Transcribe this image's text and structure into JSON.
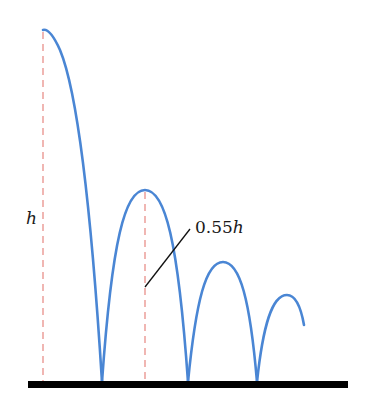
{
  "diagram": {
    "labels": {
      "initial_height": "h",
      "rebound_height": "0.55h"
    },
    "colors": {
      "trajectory": "#4a86d4",
      "dashed_guides": "#e8908a",
      "ground": "#000000",
      "leader_line": "#111111"
    },
    "bounces": [
      {
        "peak_x": 43,
        "peak_y": 30,
        "land_x": 102
      },
      {
        "start_x": 102,
        "peak_x": 145,
        "peak_y": 190,
        "land_x": 188
      },
      {
        "start_x": 188,
        "peak_x": 223,
        "peak_y": 262,
        "land_x": 257
      },
      {
        "start_x": 257,
        "peak_x": 287,
        "peak_y": 295,
        "end_x": 304
      }
    ]
  }
}
